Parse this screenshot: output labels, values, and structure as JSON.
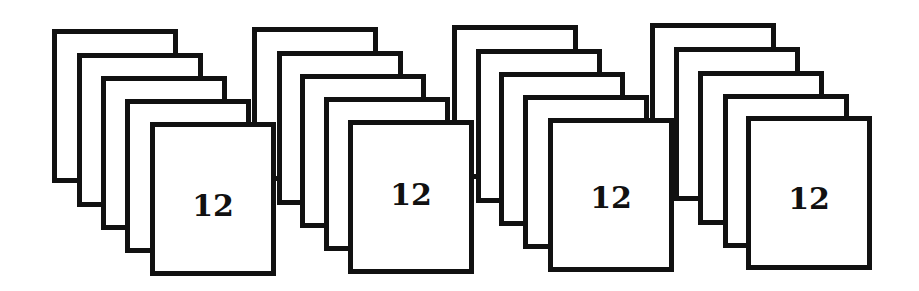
{
  "figure": {
    "background": "#ffffff",
    "stroke_color": "#111111",
    "card_width": 126,
    "card_height": 154,
    "border_width": 5,
    "cards_per_stack": 5,
    "stacks": [
      {
        "label": "12",
        "cards": [
          {
            "x": 52,
            "y": 29
          },
          {
            "x": 77,
            "y": 53
          },
          {
            "x": 101,
            "y": 76
          },
          {
            "x": 125,
            "y": 99
          },
          {
            "x": 150,
            "y": 122
          }
        ],
        "label_top": 64
      },
      {
        "label": "12",
        "cards": [
          {
            "x": 252,
            "y": 27
          },
          {
            "x": 277,
            "y": 51
          },
          {
            "x": 300,
            "y": 74
          },
          {
            "x": 324,
            "y": 97
          },
          {
            "x": 348,
            "y": 120
          }
        ],
        "label_top": 55
      },
      {
        "label": "12",
        "cards": [
          {
            "x": 452,
            "y": 25
          },
          {
            "x": 476,
            "y": 49
          },
          {
            "x": 499,
            "y": 72
          },
          {
            "x": 523,
            "y": 95
          },
          {
            "x": 548,
            "y": 118
          }
        ],
        "label_top": 60
      },
      {
        "label": "12",
        "cards": [
          {
            "x": 650,
            "y": 23
          },
          {
            "x": 674,
            "y": 47
          },
          {
            "x": 698,
            "y": 71
          },
          {
            "x": 723,
            "y": 94
          },
          {
            "x": 746,
            "y": 116
          }
        ],
        "label_top": 63
      }
    ]
  }
}
